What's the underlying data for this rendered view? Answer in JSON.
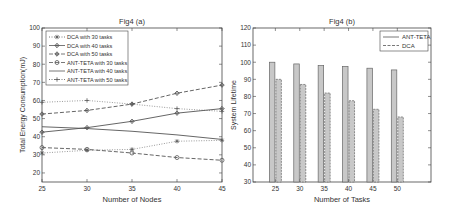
{
  "chart_data": [
    {
      "type": "line",
      "title": "Fig4 (a)",
      "xlabel": "Number of Nodes",
      "ylabel": "Total Energy Consumption(mJ)",
      "x": [
        25,
        30,
        35,
        40,
        45
      ],
      "xlim": [
        25,
        45
      ],
      "ylim": [
        15,
        100
      ],
      "yticks": [
        20,
        30,
        40,
        50,
        60,
        70,
        80,
        90,
        100
      ],
      "grid": false,
      "legend_position": "upper left",
      "series": [
        {
          "name": "DCA with 30 tasks",
          "style": "dotted",
          "marker": "*",
          "values": [
            31,
            32.5,
            33,
            37.5,
            38
          ]
        },
        {
          "name": "DCA with 40 tasks",
          "style": "solid",
          "marker": "diamond",
          "values": [
            42.5,
            45,
            48.5,
            53,
            55.5
          ]
        },
        {
          "name": "DCA with 50 tasks",
          "style": "dashed",
          "marker": "diamond",
          "values": [
            52.5,
            54.5,
            58,
            64,
            68.5
          ]
        },
        {
          "name": "ANT-TETA with 30 tasks",
          "style": "dashed",
          "marker": "o",
          "values": [
            34,
            33,
            31,
            28.5,
            27
          ]
        },
        {
          "name": "ANT-TETA with 40 tasks",
          "style": "solid",
          "marker": "none",
          "values": [
            45.5,
            44.5,
            43,
            41,
            38.5
          ]
        },
        {
          "name": "ANT-TETA with 50 tasks",
          "style": "dotted",
          "marker": "+",
          "values": [
            59,
            60,
            58,
            55.5,
            54
          ]
        }
      ]
    },
    {
      "type": "bar",
      "title": "Fig4 (b)",
      "xlabel": "Number of Tasks",
      "ylabel": "System Lifetime",
      "categories": [
        "25",
        "30",
        "35",
        "40",
        "45",
        "50"
      ],
      "ylim": [
        30,
        120
      ],
      "yticks": [
        30,
        40,
        50,
        60,
        70,
        80,
        90,
        100,
        110,
        120
      ],
      "grid": false,
      "legend_position": "upper right",
      "series": [
        {
          "name": "ANT-TETA",
          "values": [
            100,
            99,
            98,
            97.5,
            96.5,
            95.5
          ]
        },
        {
          "name": "DCA",
          "values": [
            90,
            87,
            82,
            77.5,
            72.5,
            68
          ]
        }
      ]
    }
  ],
  "colors": {
    "bar_fill": "#c8c8c8",
    "axis": "#444444",
    "line": "#555555"
  }
}
